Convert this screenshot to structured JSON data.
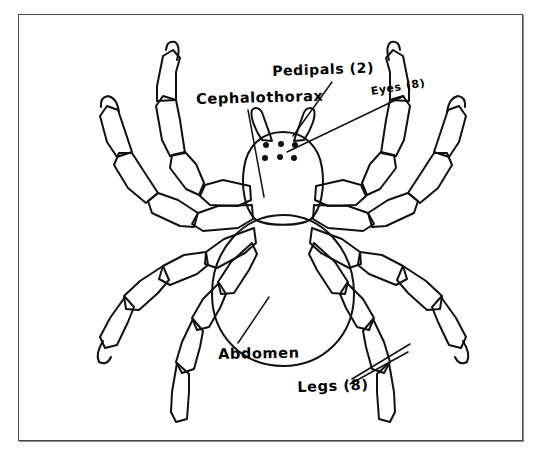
{
  "figure": {
    "style": "hand-drawn black ink line drawing on white, enclosed in a thin rectangular border",
    "background_color": "#ffffff",
    "ink_color": "#111111",
    "border_color": "#4a4a4a"
  },
  "labels": {
    "cephalothorax": "Cephalothorax",
    "pedipals": "Pedipals (2)",
    "eyes": "Eyes (8)",
    "abdomen": "Abdomen",
    "legs": "Legs (8)"
  },
  "annotations": [
    {
      "id": "cephalothorax",
      "text": "Cephalothorax",
      "points_to": "front body section of the spider",
      "leader_from": [
        248,
        110
      ],
      "leader_to": [
        263,
        196
      ]
    },
    {
      "id": "pedipals",
      "text": "Pedipals (2)",
      "points_to": "the pair of short appendages beside the mouth",
      "leader_from": [
        330,
        84
      ],
      "leader_to": [
        294,
        135
      ]
    },
    {
      "id": "eyes",
      "text": "Eyes (8)",
      "points_to": "cluster of dots on top of the cephalothorax",
      "leader_from": [
        400,
        96
      ],
      "leader_to": [
        290,
        148
      ]
    },
    {
      "id": "abdomen",
      "text": "Abdomen",
      "points_to": "large rear body section",
      "leader_from": [
        238,
        344
      ],
      "leader_to": [
        268,
        300
      ]
    },
    {
      "id": "legs",
      "text": "Legs (8)",
      "points_to": "jointed walking limbs",
      "leader_from": [
        350,
        380
      ],
      "leader_to": [
        404,
        348
      ]
    }
  ],
  "anatomy": {
    "eye_dots_drawn": 6,
    "eye_rows": 2,
    "eye_dots_per_row": 3,
    "legs_drawn": 8,
    "legs_per_side": 4,
    "leg_segments": 4,
    "pedipalps_drawn": 2,
    "body_sections": [
      "cephalothorax",
      "abdomen"
    ]
  }
}
